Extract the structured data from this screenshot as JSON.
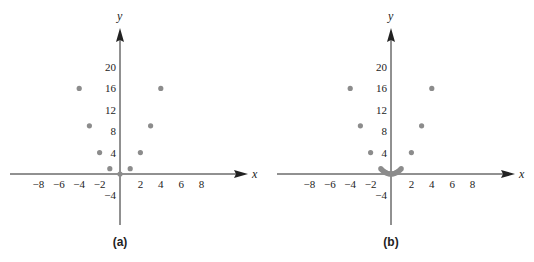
{
  "chart_data": [
    {
      "type": "scatter",
      "panel_label": "(a)",
      "xlabel": "x",
      "ylabel": "y",
      "x_ticks": [
        -8,
        -6,
        -4,
        -2,
        2,
        4,
        6,
        8
      ],
      "y_ticks": [
        20,
        16,
        12,
        8,
        4,
        -4
      ],
      "xlim": [
        -11,
        12
      ],
      "ylim": [
        -8,
        27
      ],
      "grid": false,
      "points": [
        {
          "x": -4,
          "y": 16
        },
        {
          "x": -3,
          "y": 9
        },
        {
          "x": -2,
          "y": 4
        },
        {
          "x": -1,
          "y": 1
        },
        {
          "x": 0,
          "y": 0
        },
        {
          "x": 1,
          "y": 1
        },
        {
          "x": 2,
          "y": 4
        },
        {
          "x": 3,
          "y": 9
        },
        {
          "x": 4,
          "y": 16
        }
      ],
      "point_color": "#8c8c8c"
    },
    {
      "type": "scatter",
      "panel_label": "(b)",
      "xlabel": "x",
      "ylabel": "y",
      "x_ticks": [
        -8,
        -6,
        -4,
        -2,
        2,
        4,
        6,
        8
      ],
      "y_ticks": [
        20,
        16,
        12,
        8,
        4,
        -4
      ],
      "xlim": [
        -11,
        12
      ],
      "ylim": [
        -8,
        27
      ],
      "grid": false,
      "points": [
        {
          "x": -4,
          "y": 16
        },
        {
          "x": -3,
          "y": 9
        },
        {
          "x": -2,
          "y": 4
        },
        {
          "x": -1,
          "y": 1
        },
        {
          "x": -0.875,
          "y": 0.766
        },
        {
          "x": -0.75,
          "y": 0.5625
        },
        {
          "x": -0.625,
          "y": 0.391
        },
        {
          "x": -0.5,
          "y": 0.25
        },
        {
          "x": -0.375,
          "y": 0.141
        },
        {
          "x": -0.25,
          "y": 0.0625
        },
        {
          "x": -0.125,
          "y": 0.0156
        },
        {
          "x": 0,
          "y": 0
        },
        {
          "x": 0.125,
          "y": 0.0156
        },
        {
          "x": 0.25,
          "y": 0.0625
        },
        {
          "x": 0.375,
          "y": 0.141
        },
        {
          "x": 0.5,
          "y": 0.25
        },
        {
          "x": 0.625,
          "y": 0.391
        },
        {
          "x": 0.75,
          "y": 0.5625
        },
        {
          "x": 0.875,
          "y": 0.766
        },
        {
          "x": 1,
          "y": 1
        },
        {
          "x": 2,
          "y": 4
        },
        {
          "x": 3,
          "y": 9
        },
        {
          "x": 4,
          "y": 16
        }
      ],
      "point_color": "#8c8c8c"
    }
  ]
}
